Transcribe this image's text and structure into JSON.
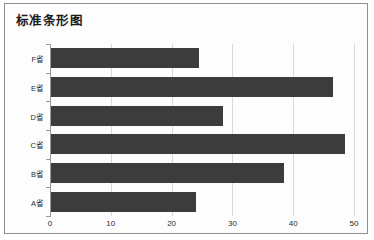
{
  "card": {
    "title": "标准条形图",
    "border_color": "#8f8f8f",
    "background_color": "#fdfdfd"
  },
  "chart_data": {
    "type": "bar",
    "orientation": "horizontal",
    "title": "标准条形图",
    "xlabel": "",
    "ylabel": "",
    "categories": [
      "A省",
      "B省",
      "C省",
      "D省",
      "E省",
      "F省"
    ],
    "values": [
      24,
      38.5,
      48.5,
      28.5,
      46.5,
      24.5
    ],
    "xlim": [
      0,
      50
    ],
    "xticks": [
      0,
      10,
      20,
      30,
      40,
      50
    ],
    "xtick_labels": [
      "0",
      "10",
      "20",
      "30",
      "40",
      "50"
    ],
    "grid": true,
    "grid_axis": "x",
    "legend": false,
    "bar_color": "#3c3c3c",
    "grid_color": "#d9d9d9",
    "axis_color": "#9a9a9a",
    "series": [
      {
        "name": "",
        "values": [
          24,
          38.5,
          48.5,
          28.5,
          46.5,
          24.5
        ]
      }
    ],
    "bars_top_to_bottom": [
      {
        "category": "F省",
        "value": 24.5
      },
      {
        "category": "E省",
        "value": 46.5
      },
      {
        "category": "D省",
        "value": 28.5
      },
      {
        "category": "C省",
        "value": 48.5
      },
      {
        "category": "B省",
        "value": 38.5
      },
      {
        "category": "A省",
        "value": 24
      }
    ]
  }
}
